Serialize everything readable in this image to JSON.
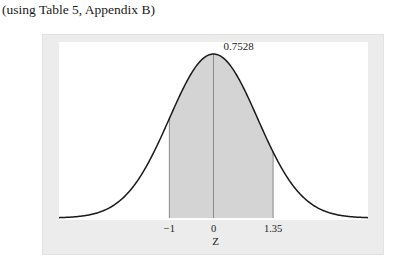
{
  "caption": "(using Table 5, Appendix B)",
  "chart_data": {
    "type": "area",
    "title": "",
    "distribution": "standard normal",
    "xlabel": "Z",
    "ylabel": "",
    "xlim": [
      -3.5,
      3.5
    ],
    "shaded_region": {
      "from": -1,
      "to": 1.35
    },
    "shaded_area_label": "0.7528",
    "tick_labels": [
      {
        "x": -1,
        "label": "−1"
      },
      {
        "x": 0,
        "label": "0"
      },
      {
        "x": 1.35,
        "label": "1.35"
      }
    ],
    "reference_lines": [
      -1,
      0,
      1.35
    ],
    "grid": false,
    "legend": "none",
    "colors": {
      "curve": "#1a1a1a",
      "fill": "#d4d4d4",
      "frame": "#ececec",
      "plot_bg": "#ffffff"
    }
  }
}
